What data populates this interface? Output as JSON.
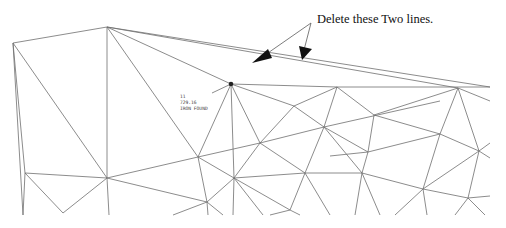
{
  "annotation": {
    "text": "Delete these Two lines.",
    "color": "#111111"
  },
  "point_label": {
    "line1": "11",
    "line2": "729.16",
    "line3": "IRON FOUND"
  },
  "colors": {
    "mesh": "#6e6e6e",
    "arrow": "#111111",
    "background": "#ffffff"
  }
}
